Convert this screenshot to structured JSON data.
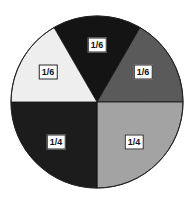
{
  "chart_data": {
    "type": "pie",
    "title": "",
    "slices": [
      {
        "label": "1/6",
        "value": 0.1667,
        "color": "#141414",
        "position": "top"
      },
      {
        "label": "1/6",
        "value": 0.1667,
        "color": "#5a5a5a",
        "position": "upper-right"
      },
      {
        "label": "1/4",
        "value": 0.25,
        "color": "#a3a3a3",
        "position": "lower-right"
      },
      {
        "label": "1/4",
        "value": 0.25,
        "color": "#1c1c1c",
        "position": "lower-left"
      },
      {
        "label": "1/6",
        "value": 0.1667,
        "color": "#eeeeee",
        "position": "upper-left"
      }
    ],
    "legend": "none",
    "center": [
      97,
      102
    ],
    "radius": 86
  },
  "labels": [
    {
      "text": "1/6",
      "x": 97,
      "y": 45
    },
    {
      "text": "1/6",
      "x": 143,
      "y": 72
    },
    {
      "text": "1/4",
      "x": 134,
      "y": 142
    },
    {
      "text": "1/4",
      "x": 56,
      "y": 142
    },
    {
      "text": "1/6",
      "x": 48,
      "y": 72
    }
  ]
}
